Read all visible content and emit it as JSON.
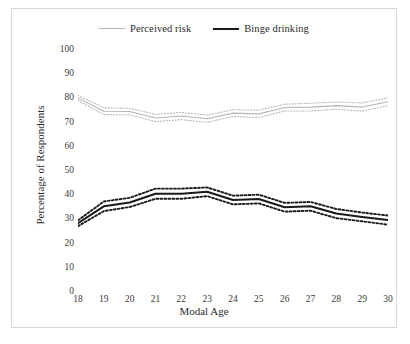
{
  "chart_data": {
    "type": "line",
    "title": "",
    "xlabel": "Modal Age",
    "ylabel": "Percentage of Respondents",
    "categories": [
      "18",
      "19",
      "20",
      "21",
      "22",
      "23",
      "24",
      "25",
      "26",
      "27",
      "28",
      "29",
      "30"
    ],
    "x": [
      18,
      19,
      20,
      21,
      22,
      23,
      24,
      25,
      26,
      27,
      28,
      29,
      30
    ],
    "xlim": [
      18,
      30
    ],
    "ylim": [
      0,
      100
    ],
    "yticks": [
      "0",
      "10",
      "20",
      "30",
      "40",
      "50",
      "60",
      "70",
      "80",
      "90",
      "100"
    ],
    "ytick_values": [
      0,
      10,
      20,
      30,
      40,
      50,
      60,
      70,
      80,
      90,
      100
    ],
    "grid": false,
    "legend_position": "top-center",
    "series": [
      {
        "name": "Perceived risk",
        "color": "#b6b6b6",
        "style": "solid",
        "values": [
          79.8,
          74.3,
          74.2,
          71.5,
          72.3,
          71.2,
          73.5,
          73.2,
          75.8,
          76.0,
          76.6,
          76.0,
          78.2
        ],
        "ci_upper": [
          80.8,
          75.7,
          75.5,
          73.0,
          73.8,
          72.7,
          74.9,
          74.7,
          77.2,
          77.6,
          78.1,
          77.7,
          79.8
        ],
        "ci_lower": [
          78.8,
          72.9,
          72.8,
          70.0,
          70.8,
          69.7,
          72.1,
          71.7,
          74.4,
          74.4,
          75.1,
          74.3,
          76.6
        ]
      },
      {
        "name": "Binge drinking",
        "color": "#1a1a1a",
        "style": "solid",
        "values": [
          28.0,
          35.0,
          36.6,
          40.2,
          40.2,
          41.0,
          37.6,
          38.0,
          34.6,
          35.0,
          32.0,
          30.6,
          29.3
        ],
        "ci_upper": [
          29.2,
          37.0,
          38.5,
          42.3,
          42.3,
          42.8,
          39.4,
          39.8,
          36.4,
          36.8,
          33.9,
          32.4,
          31.2
        ],
        "ci_lower": [
          26.8,
          33.0,
          34.7,
          38.1,
          38.1,
          39.2,
          35.8,
          36.2,
          32.8,
          33.2,
          30.1,
          28.8,
          27.4
        ]
      }
    ]
  },
  "legend": {
    "entries": [
      {
        "label": "Perceived risk"
      },
      {
        "label": "Binge drinking"
      }
    ]
  },
  "axes": {
    "x_title": "Modal Age",
    "y_title": "Percentage of Respondents"
  }
}
